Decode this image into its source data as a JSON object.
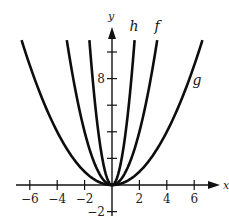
{
  "chart_data": {
    "type": "line",
    "title": "",
    "xlabel": "x",
    "ylabel": "y",
    "xlim": [
      -7.5,
      7.5
    ],
    "ylim": [
      -2,
      11
    ],
    "grid": false,
    "x_ticks": [
      -6,
      -4,
      -2,
      2,
      4,
      6
    ],
    "x_tick_labels": [
      "−6",
      "−4",
      "−2",
      "2",
      "4",
      "6"
    ],
    "y_ticks": [
      -2,
      2,
      4,
      6,
      8,
      10
    ],
    "y_tick_labels_shown": [
      {
        "value": 8,
        "label": "8"
      },
      {
        "value": -2,
        "label": "−2"
      }
    ],
    "series": [
      {
        "name": "h",
        "formula": "y = 4x^2",
        "coef": 4,
        "x_range": [
          -1.65,
          1.65
        ],
        "label_pos": {
          "x": 1.6,
          "y": 11.6
        }
      },
      {
        "name": "f",
        "formula": "y = x^2",
        "coef": 1,
        "x_range": [
          -3.3,
          3.3
        ],
        "label_pos": {
          "x": 3.3,
          "y": 11.6
        }
      },
      {
        "name": "g",
        "formula": "y = x^2/4",
        "coef": 0.25,
        "x_range": [
          -6.6,
          6.6
        ],
        "label_pos": {
          "x": 6.2,
          "y": 7.5
        }
      }
    ],
    "legend": "none (inline curve labels)"
  },
  "labels": {
    "x_axis": "x",
    "y_axis": "y",
    "h": "h",
    "f": "f",
    "g": "g"
  }
}
